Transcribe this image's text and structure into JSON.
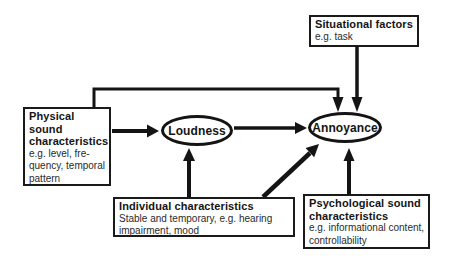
{
  "figure": {
    "background_color": "#ffffff",
    "ink_color": "#141414",
    "boxes": {
      "situational": {
        "title": "Situational factors",
        "body": [
          "e.g. task"
        ]
      },
      "physical": {
        "title": [
          "Physical",
          "sound",
          "characteristics"
        ],
        "body": [
          "e.g. level, fre-",
          "quency, temporal",
          "pattern"
        ]
      },
      "individual": {
        "title": "Individual characteristics",
        "body": [
          "Stable and temporary, e.g. hearing",
          "impairment, mood"
        ]
      },
      "psychological": {
        "title": [
          "Psychological sound",
          "characteristics"
        ],
        "body": [
          "e.g. informational content,",
          "controllability"
        ]
      }
    },
    "nodes": {
      "loudness": "Loudness",
      "annoyance": "Annoyance"
    },
    "edges": [
      {
        "from": "physical-sound-characteristics",
        "to": "loudness"
      },
      {
        "from": "physical-sound-characteristics",
        "to": "annoyance"
      },
      {
        "from": "situational-factors",
        "to": "annoyance"
      },
      {
        "from": "loudness",
        "to": "annoyance"
      },
      {
        "from": "individual-characteristics",
        "to": "loudness"
      },
      {
        "from": "individual-characteristics",
        "to": "annoyance"
      },
      {
        "from": "psychological-sound-characteristics",
        "to": "annoyance"
      }
    ]
  }
}
